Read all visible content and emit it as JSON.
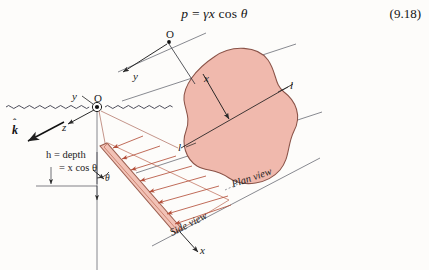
{
  "figure": {
    "kind": "engineering-diagram",
    "background_color": "#fdfcfa"
  },
  "equation": {
    "lhs": "p",
    "equals": "=",
    "rhs_gamma": "γ",
    "rhs_x": "x",
    "rhs_cos": "cos",
    "rhs_theta": "θ",
    "full_text": "p = γx cos θ",
    "number": "(9.18)"
  },
  "labels": {
    "origin_top": "O",
    "origin_surface": "O",
    "axis_y_top": "y",
    "axis_y_surface": "y",
    "axis_z": "z",
    "axis_x_plan": "x",
    "axis_x_side": "x",
    "unit_vector_k": "k",
    "unit_vector_k_hat": "ˆ",
    "angle_theta": "θ",
    "section_line_left": "l",
    "section_line_right": "l",
    "depth_line1": "h = depth",
    "depth_line2": "= x cos θ",
    "plan_view": "Plan view",
    "side_view": "Side view"
  },
  "colors": {
    "surface_fill": "#f0b9ad",
    "surface_stroke": "#8a5348",
    "plate_fill": "#f2c2b6",
    "plate_stroke": "#9c5f50",
    "pressure_arrow": "#b5513c",
    "construction_line": "#585a63",
    "axis_line": "#1f1f1f",
    "water_line": "#3a3a48",
    "text": "#1b1b1b"
  },
  "geometry": {
    "water_surface_y": 107,
    "origin_surface": [
      97,
      107
    ],
    "origin_top": [
      169,
      42
    ],
    "plate_angle_deg": 62,
    "section_label_count": 2,
    "pressure_arrow_count": 8
  }
}
